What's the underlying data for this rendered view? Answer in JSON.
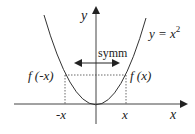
{
  "diagram": {
    "curve_label": "y = x",
    "curve_exponent": "2",
    "y_axis_label": "y",
    "x_axis_label": "x",
    "symmetry_label": "symm",
    "left_value_label": "f (-x)",
    "right_value_label": "f (x)",
    "left_tick_label": "-x",
    "right_tick_label": "x",
    "colors": {
      "line": "#333333",
      "background": "#ffffff"
    }
  }
}
